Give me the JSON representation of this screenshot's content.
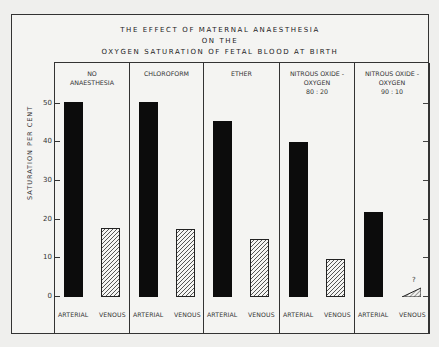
{
  "chart_data": {
    "type": "bar",
    "title_lines": [
      "THE EFFECT OF MATERNAL ANAESTHESIA",
      "ON THE",
      "OXYGEN SATURATION OF FETAL BLOOD AT BIRTH"
    ],
    "ylabel": "SATURATION PER CENT",
    "xlabel": "",
    "ylim": [
      0,
      50
    ],
    "yticks": [
      0,
      10,
      20,
      30,
      40,
      50
    ],
    "grid": false,
    "categories": [
      "NO ANAESTHESIA",
      "CHLOROFORM",
      "ETHER",
      "NITROUS OXIDE - OXYGEN 80 : 20",
      "NITROUS OXIDE - OXYGEN 90 : 10"
    ],
    "category_labels": [
      "NO\nANAESTHESIA",
      "CHLOROFORM",
      "ETHER",
      "NITROUS OXIDE -\nOXYGEN\n80 : 20",
      "NITROUS OXIDE -\nOXYGEN\n90 : 10"
    ],
    "series": [
      {
        "name": "ARTERIAL",
        "style": "solid black",
        "values": [
          50.5,
          50.5,
          45.5,
          40,
          22
        ]
      },
      {
        "name": "VENOUS",
        "style": "hatched",
        "values": [
          17.8,
          17.5,
          15,
          9.8,
          2.5
        ]
      }
    ],
    "annotations": [
      {
        "category": "NITROUS OXIDE - OXYGEN 90 : 10",
        "series": "VENOUS",
        "text": "?",
        "note": "drawn as small triangle 0 to ~2.5"
      }
    ],
    "bar_labels": [
      "ARTERIAL",
      "VENOUS"
    ]
  }
}
